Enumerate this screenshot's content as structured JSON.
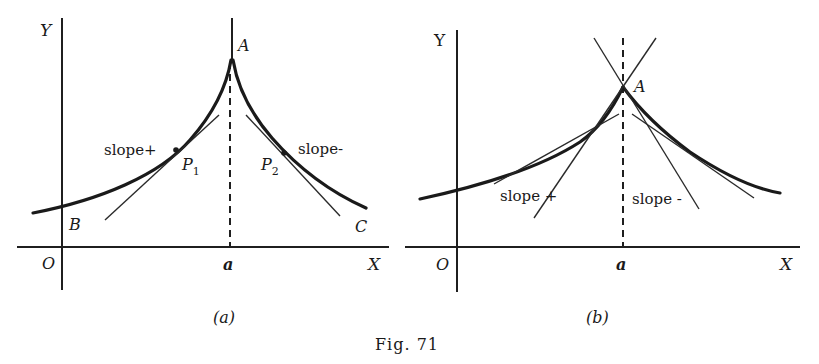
{
  "figure": {
    "caption": "Fig. 71",
    "panels": [
      {
        "id": "a",
        "sublabel": "(a)",
        "axis_labels": {
          "y": "Y",
          "x": "X",
          "origin": "O",
          "tick": "a"
        },
        "point_labels": {
          "peak": "A",
          "left_intercept": "B",
          "right_end": "C",
          "p1": "P",
          "p1_sub": "1",
          "p2": "P",
          "p2_sub": "2"
        },
        "annotations": {
          "slope_pos": "slope+",
          "slope_neg": "slope-"
        },
        "description": "Cusp at A (x = a): slope positive on left, negative on right, curve tangent becomes vertical at A"
      },
      {
        "id": "b",
        "sublabel": "(b)",
        "axis_labels": {
          "y": "Y",
          "x": "X",
          "origin": "O",
          "tick": "a"
        },
        "point_labels": {
          "peak": "A"
        },
        "annotations": {
          "slope_pos": "slope +",
          "slope_neg": "slope -"
        },
        "description": "Corner at A (x = a): finite but different left and right tangent slopes"
      }
    ]
  },
  "colors": {
    "ink": "#1a1a1a",
    "paper": "#ffffff"
  }
}
